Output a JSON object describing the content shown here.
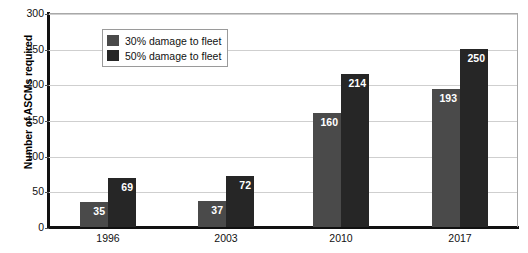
{
  "chart_data": {
    "type": "bar",
    "title": "",
    "xlabel": "",
    "ylabel": "Number of ASCMs required",
    "categories": [
      "1996",
      "2003",
      "2010",
      "2017"
    ],
    "series": [
      {
        "name": "30% damage to fleet",
        "color": "#4a4a4a",
        "values": [
          35,
          37,
          160,
          193
        ]
      },
      {
        "name": "50% damage to fleet",
        "color": "#262626",
        "values": [
          69,
          72,
          214,
          250
        ]
      }
    ],
    "ylim": [
      0,
      300
    ],
    "yticks": [
      0,
      50,
      100,
      150,
      200,
      250,
      300
    ],
    "ytick_labels": [
      "0",
      "50",
      "100",
      "150",
      "200",
      "250",
      "300"
    ],
    "grid": true,
    "legend_position": "upper-left-inside",
    "data_labels": true
  }
}
